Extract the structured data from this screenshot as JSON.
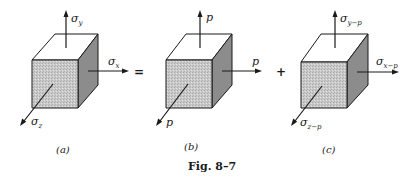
{
  "figure": {
    "caption": "Fig. 8–7",
    "operators": {
      "equals": "=",
      "plus": "+"
    },
    "colors": {
      "front_face": "#c9c9c9",
      "side_face": "#8c8c8c",
      "top_face": "#ffffff",
      "ink": "#1a1a1a"
    },
    "panels": [
      {
        "id": "a",
        "label": "(a)",
        "arrows": {
          "y": {
            "symbol": "σ",
            "subscript": "y"
          },
          "x": {
            "symbol": "σ",
            "subscript": "x"
          },
          "z": {
            "symbol": "σ",
            "subscript": "z"
          }
        }
      },
      {
        "id": "b",
        "label": "(b)",
        "arrows": {
          "y": {
            "symbol": "p",
            "subscript": ""
          },
          "x": {
            "symbol": "p",
            "subscript": ""
          },
          "z": {
            "symbol": "p",
            "subscript": ""
          }
        }
      },
      {
        "id": "c",
        "label": "(c)",
        "arrows": {
          "y": {
            "symbol": "σ",
            "subscript": "y−p"
          },
          "x": {
            "symbol": "σ",
            "subscript": "x−p"
          },
          "z": {
            "symbol": "σ",
            "subscript": "z−p"
          }
        }
      }
    ]
  }
}
